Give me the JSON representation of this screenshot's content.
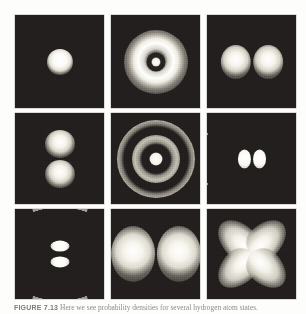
{
  "figure": {
    "label": "FIGURE 7.13",
    "caption": "Here we see probability densities for several hydrogen atom states.",
    "background_color": "#fdfdfb",
    "panel_background_color": "#231f1e",
    "highlight_color": "#ffffff",
    "midtone_color": "#9d9a90"
  },
  "grid": {
    "rows": 3,
    "columns": 3,
    "panels": [
      {
        "index": 1,
        "position": "top-left",
        "name": "1s",
        "description": "single spherical bright core",
        "features": [
          "bright-core"
        ]
      },
      {
        "index": 2,
        "position": "top-center",
        "name": "2s",
        "description": "bright annulus with dark radial node and small bright core",
        "features": [
          "bright-core",
          "dark-node-ring",
          "bright-halo"
        ]
      },
      {
        "index": 3,
        "position": "top-right",
        "name": "2p horizontal",
        "description": "two bright lobes side by side with vertical nodal plane",
        "features": [
          "left-lobe",
          "right-lobe"
        ]
      },
      {
        "index": 4,
        "position": "middle-left",
        "name": "2p vertical",
        "description": "two bright lobes stacked with horizontal nodal plane",
        "features": [
          "top-lobe",
          "bottom-lobe"
        ]
      },
      {
        "index": 5,
        "position": "middle-center",
        "name": "3s",
        "description": "bright core with two concentric bright rings separated by dark nodes",
        "features": [
          "bright-core",
          "inner-ring",
          "outer-ring"
        ]
      },
      {
        "index": 6,
        "position": "middle-right",
        "name": "3p horizontal",
        "description": "two small central lobes flanked by two large crescent arcs",
        "features": [
          "left-inner-lobe",
          "right-inner-lobe",
          "left-crescent",
          "right-crescent"
        ]
      },
      {
        "index": 7,
        "position": "bottom-left",
        "name": "3p vertical",
        "description": "two small stacked central lobes with crescent arcs above and below",
        "features": [
          "top-inner-lobe",
          "bottom-inner-lobe",
          "top-crescent",
          "bottom-crescent"
        ]
      },
      {
        "index": 8,
        "position": "bottom-center",
        "name": "3d horizontal dipole",
        "description": "two large bright lobes side by side",
        "features": [
          "left-lobe",
          "right-lobe"
        ]
      },
      {
        "index": 9,
        "position": "bottom-right",
        "name": "3d cloverleaf",
        "description": "four diagonal lobes forming a cloverleaf pattern",
        "features": [
          "top-left-lobe",
          "top-right-lobe",
          "bottom-left-lobe",
          "bottom-right-lobe"
        ]
      }
    ]
  }
}
